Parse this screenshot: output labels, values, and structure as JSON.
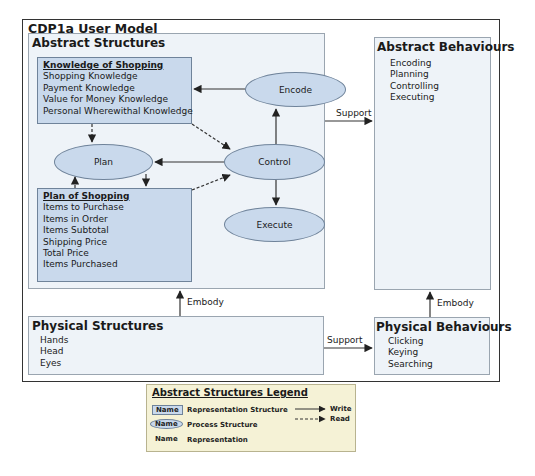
{
  "title": "CDP1a User Model",
  "abstract_structures": {
    "title": "Abstract Structures",
    "knowledge_box": {
      "title": "Knowledge of Shopping",
      "items": [
        "Shopping Knowledge",
        "Payment Knowledge",
        "Value for Money Knowledge",
        "Personal Wherewithal Knowledge"
      ]
    },
    "plan_box": {
      "title": "Plan of Shopping",
      "items": [
        "Items to Purchase",
        "Items in Order",
        "Items Subtotal",
        "Shipping Price",
        "Total Price",
        "Items Purchased"
      ]
    },
    "processes": {
      "encode": "Encode",
      "plan": "Plan",
      "control": "Control",
      "execute": "Execute"
    }
  },
  "abstract_behaviours": {
    "title": "Abstract Behaviours",
    "items": [
      "Encoding",
      "Planning",
      "Controlling",
      "Executing"
    ]
  },
  "physical_structures": {
    "title": "Physical Structures",
    "items": [
      "Hands",
      "Head",
      "Eyes"
    ]
  },
  "physical_behaviours": {
    "title": "Physical Behaviours",
    "items": [
      "Clicking",
      "Keying",
      "Searching"
    ]
  },
  "connections": {
    "support_top": "Support",
    "support_bottom": "Support",
    "embody_left": "Embody",
    "embody_right": "Embody"
  },
  "legend": {
    "title": "Abstract Structures Legend",
    "rows": [
      {
        "swatch": "Name",
        "label": "Representation Structure"
      },
      {
        "swatch": "Name",
        "label": "Process Structure"
      },
      {
        "swatch": "Name",
        "label": "Representation"
      }
    ],
    "write": "Write",
    "read": "Read"
  },
  "colors": {
    "box_fill": "#c9d9ec",
    "panel_fill": "#eef3f8",
    "legend_fill": "#f5f2d6"
  }
}
